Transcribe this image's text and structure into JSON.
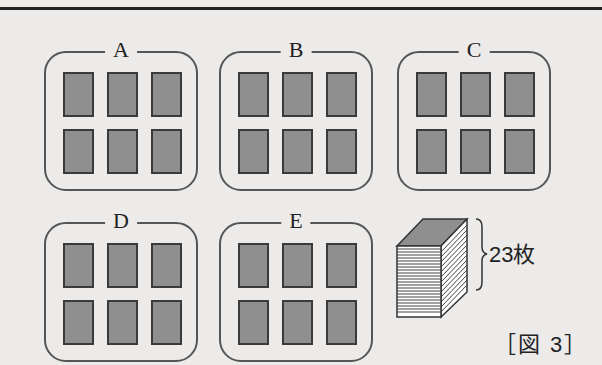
{
  "figure": {
    "caption": "［図 3］",
    "groups": [
      {
        "label": "A",
        "cards": 6
      },
      {
        "label": "B",
        "cards": 6
      },
      {
        "label": "C",
        "cards": 6
      },
      {
        "label": "D",
        "cards": 6
      },
      {
        "label": "E",
        "cards": 6
      }
    ],
    "stack": {
      "count_label": "23枚"
    },
    "colors": {
      "card_fill": "#8f8f8f",
      "card_border": "#3a3a3a",
      "background": "#ecebea"
    }
  }
}
